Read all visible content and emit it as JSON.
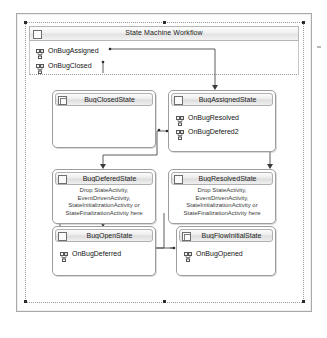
{
  "designer": {
    "name": "state-machine-workflow-designer",
    "surface_title": "State Machine Workflow",
    "surface_icon": "workflow-icon"
  },
  "root_events": [
    {
      "label": "OnBugAssigned",
      "icon": "event-handler-icon"
    },
    {
      "label": "OnBugClosed",
      "icon": "event-handler-icon"
    }
  ],
  "states": [
    {
      "id": "bug-closed-state",
      "title": "BugClosedState",
      "icon": "initial-state-icon",
      "events": [],
      "drop_hint": ""
    },
    {
      "id": "bug-assigned-state",
      "title": "BugAssignedState",
      "icon": "state-icon",
      "events": [
        {
          "label": "OnBugResolved",
          "icon": "event-handler-icon"
        },
        {
          "label": "OnBugDefered2",
          "icon": "event-handler-icon"
        }
      ],
      "drop_hint": ""
    },
    {
      "id": "bug-deferred-state",
      "title": "BugDeferedState",
      "icon": "state-icon",
      "events": [],
      "drop_hint": "Drop StateActivity, EventDrivenActivity, StateInitializationActivity or StateFinalizationActivity here"
    },
    {
      "id": "bug-resolved-state",
      "title": "BugResolvedState",
      "icon": "state-icon",
      "events": [],
      "drop_hint": "Drop StateActivity, EventDrivenActivity, StateInitializationActivity or StateFinalizationActivity here"
    },
    {
      "id": "bug-open-state",
      "title": "BugOpenState",
      "icon": "state-icon",
      "events": [
        {
          "label": "OnBugDeferred",
          "icon": "event-handler-icon"
        }
      ],
      "drop_hint": ""
    },
    {
      "id": "bug-flow-initial-state",
      "title": "BugFlowInitialState",
      "icon": "initial-state-icon",
      "events": [
        {
          "label": "OnBugOpened",
          "icon": "event-handler-icon"
        }
      ],
      "drop_hint": ""
    }
  ],
  "drop_hint_lines": {
    "line1": "Drop StateActivity,",
    "line2": "EventDrivenActivity,",
    "line3": "StateInitializationActivity or",
    "line4": "StateFinalizationActivity here"
  },
  "colors": {
    "surface": "#ffffff",
    "frame_border": "#a9a9a9",
    "box_border": "#9d9d9d",
    "header_gradient_top": "#fcfcfc",
    "header_gradient_bottom": "#dcdcdc",
    "wire": "#4a4a4a",
    "handle": "#2b2b2b",
    "text": "#141414"
  }
}
